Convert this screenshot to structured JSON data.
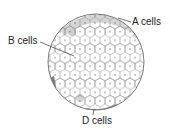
{
  "diagram": {
    "labels": {
      "a_cells": "A cells",
      "b_cells": "B cells",
      "d_cells": "D cells"
    },
    "colors": {
      "outline": "#6b6b6b",
      "cell_fill": "#ffffff",
      "a_cell_fill": "#d6d6d6",
      "d_cell_fill": "#8a8a8a",
      "background": "#ffffff"
    }
  }
}
